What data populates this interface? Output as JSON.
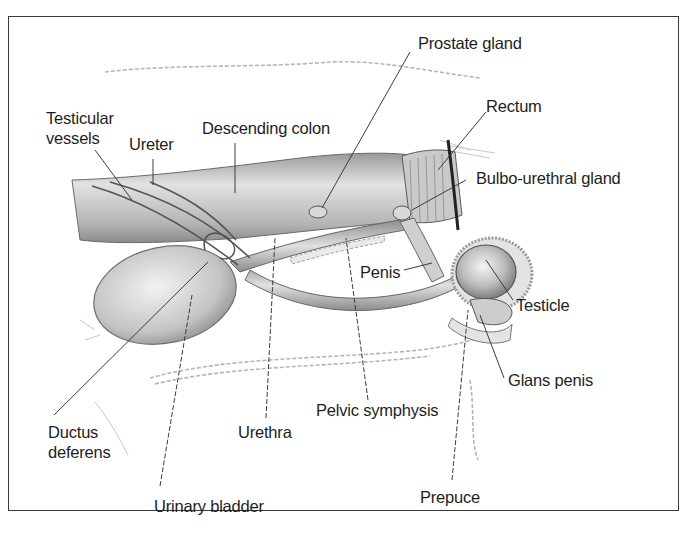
{
  "diagram": {
    "type": "anatomical-illustration",
    "labels": {
      "prostate_gland": "Prostate gland",
      "rectum": "Rectum",
      "testicular_vessels_line1": "Testicular",
      "testicular_vessels_line2": "vessels",
      "ureter": "Ureter",
      "descending_colon": "Descending colon",
      "bulbo_urethral_gland": "Bulbo-urethral gland",
      "penis": "Penis",
      "testicle": "Testicle",
      "glans_penis": "Glans penis",
      "ductus_deferens_line1": "Ductus",
      "ductus_deferens_line2": "deferens",
      "urethra": "Urethra",
      "pelvic_symphysis": "Pelvic symphysis",
      "prepuce": "Prepuce",
      "urinary_bladder": "Urinary bladder"
    },
    "colors": {
      "border": "#3a3a3a",
      "text": "#1e1e1e",
      "leader_line": "#3c3c3c",
      "tissue_shading": "#bdbdbd"
    }
  }
}
